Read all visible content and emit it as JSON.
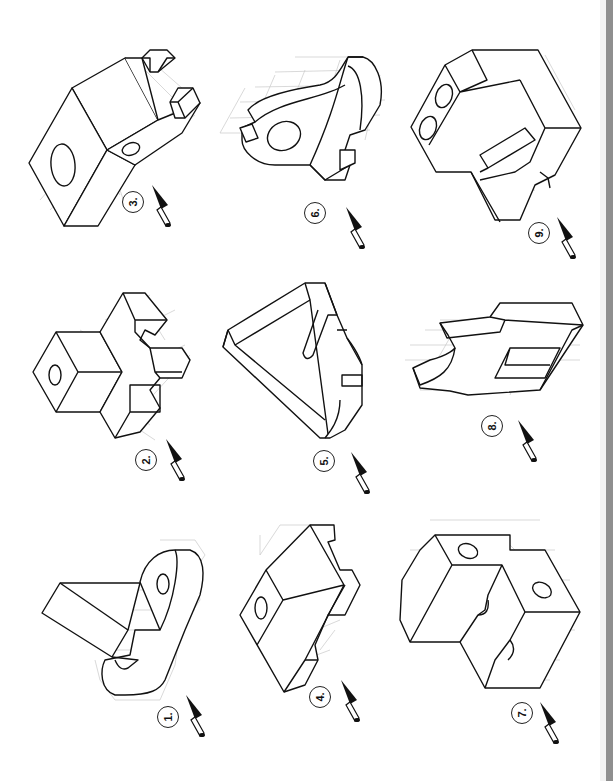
{
  "page": {
    "orientation": "rotated-90-ccw",
    "edge_color": "#8f8f8f",
    "line_color": "#111111",
    "grid_color": "#c8c8c8"
  },
  "figures": [
    {
      "id": 1,
      "label": "1.",
      "icon": "view-direction-arrow-icon",
      "features": [
        "angled block arm",
        "rounded tab with hole",
        "slotted base with hole"
      ]
    },
    {
      "id": 2,
      "label": "2.",
      "icon": "view-direction-arrow-icon",
      "features": [
        "square prism with hole",
        "cross-shaped stepped base"
      ]
    },
    {
      "id": 3,
      "label": "3.",
      "icon": "view-direction-arrow-icon",
      "features": [
        "large block with circular hole",
        "angled arm with hole",
        "two small cube studs"
      ]
    },
    {
      "id": 4,
      "label": "4.",
      "icon": "view-direction-arrow-icon",
      "features": [
        "wedge block with hole",
        "notched base"
      ]
    },
    {
      "id": 5,
      "label": "5.",
      "icon": "view-direction-arrow-icon",
      "features": [
        "triangular frame",
        "slot",
        "curved notched rim"
      ]
    },
    {
      "id": 6,
      "label": "6.",
      "icon": "view-direction-arrow-icon",
      "features": [
        "curved hook plate",
        "elliptical hole",
        "stepped block"
      ]
    },
    {
      "id": 7,
      "label": "7.",
      "icon": "view-direction-arrow-icon",
      "features": [
        "L-shaped block",
        "two holes",
        "semicircular groove"
      ]
    },
    {
      "id": 8,
      "label": "8.",
      "icon": "view-direction-arrow-icon",
      "features": [
        "plate with curved cutout",
        "rectangular pocket",
        "raised rail"
      ]
    },
    {
      "id": 9,
      "label": "9.",
      "icon": "view-direction-arrow-icon",
      "features": [
        "hexagonal block",
        "two holes",
        "diagonal slot",
        "V-notch"
      ]
    }
  ]
}
